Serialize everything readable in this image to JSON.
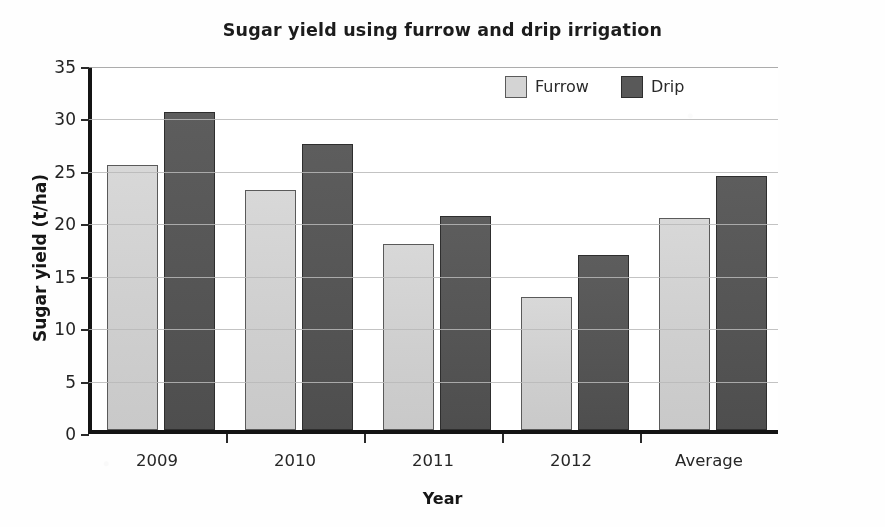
{
  "chart_data": {
    "type": "bar",
    "title": "Sugar yield using furrow and drip irrigation",
    "xlabel": "Year",
    "ylabel": "Sugar yield (t/ha)",
    "categories": [
      "2009",
      "2010",
      "2011",
      "2012",
      "Average"
    ],
    "series": [
      {
        "name": "Furrow",
        "color": "#d4d4d4",
        "values": [
          25.3,
          22.9,
          17.7,
          12.7,
          20.2
        ]
      },
      {
        "name": "Drip",
        "color": "#595959",
        "values": [
          30.3,
          27.3,
          20.4,
          16.7,
          24.2
        ]
      }
    ],
    "ylim": [
      0,
      35
    ],
    "yticks": [
      0,
      5,
      10,
      15,
      20,
      25,
      30,
      35
    ],
    "ytick_labels": [
      "0",
      "5",
      "10",
      "15",
      "20",
      "25",
      "30",
      "35"
    ],
    "grid": true,
    "grid_axis": "y",
    "legend_position": "top-right"
  }
}
